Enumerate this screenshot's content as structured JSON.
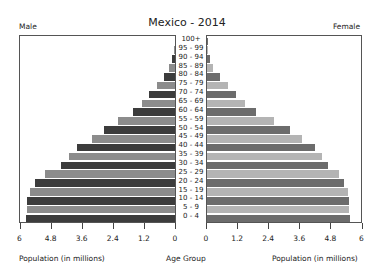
{
  "chart_data": {
    "type": "bar",
    "subtype": "population-pyramid",
    "title": "Mexico - 2014",
    "left_label": "Male",
    "right_label": "Female",
    "xlabel_left": "Population (in millions)",
    "xlabel_center": "Age Group",
    "xlabel_right": "Population (in millions)",
    "xlim": [
      0,
      6
    ],
    "left_ticks": [
      "6",
      "4.8",
      "3.6",
      "2.4",
      "1.2",
      "0"
    ],
    "right_ticks": [
      "0",
      "1.2",
      "2.4",
      "3.6",
      "4.8",
      "6"
    ],
    "categories": [
      "100+",
      "95 - 99",
      "90 - 94",
      "85 - 89",
      "80 - 84",
      "75 - 79",
      "70 - 74",
      "65 - 69",
      "60 - 64",
      "55 - 59",
      "50 - 54",
      "45 - 49",
      "40 - 44",
      "35 - 39",
      "30 - 34",
      "25 - 29",
      "20 - 24",
      "15 - 19",
      "10 - 14",
      "5 - 9",
      "0 - 4"
    ],
    "series": [
      {
        "name": "Male",
        "values": [
          0.0,
          0.02,
          0.12,
          0.23,
          0.43,
          0.7,
          1.0,
          1.28,
          1.63,
          2.2,
          2.75,
          3.2,
          3.8,
          4.1,
          4.4,
          5.0,
          5.4,
          5.6,
          5.7,
          5.7,
          5.75
        ]
      },
      {
        "name": "Female",
        "values": [
          0.01,
          0.04,
          0.1,
          0.25,
          0.5,
          0.8,
          1.12,
          1.47,
          1.9,
          2.6,
          3.2,
          3.65,
          4.15,
          4.45,
          4.65,
          5.1,
          5.3,
          5.45,
          5.47,
          5.47,
          5.5
        ]
      }
    ],
    "grid": false,
    "legend": "none"
  },
  "colors": {
    "male_dark": "#3c3c3c",
    "male_light": "#8c8c8c",
    "female_dark": "#6c6c6c",
    "female_light": "#b4b4b4",
    "frame": "#555555"
  }
}
